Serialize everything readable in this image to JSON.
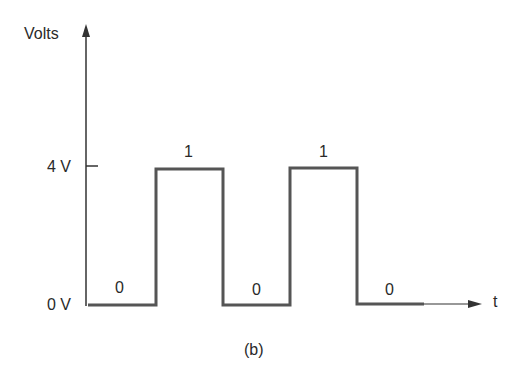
{
  "diagram": {
    "caption": "(b)",
    "y_axis_label": "Volts",
    "x_axis_label": "t",
    "levels": [
      {
        "label": "4 V",
        "value": 4
      },
      {
        "label": "0 V",
        "value": 0
      }
    ],
    "bits": [
      "0",
      "1",
      "0",
      "1",
      "0"
    ],
    "colors": {
      "line": "#555555",
      "axis": "#333333",
      "text": "#2a2a2a"
    }
  }
}
